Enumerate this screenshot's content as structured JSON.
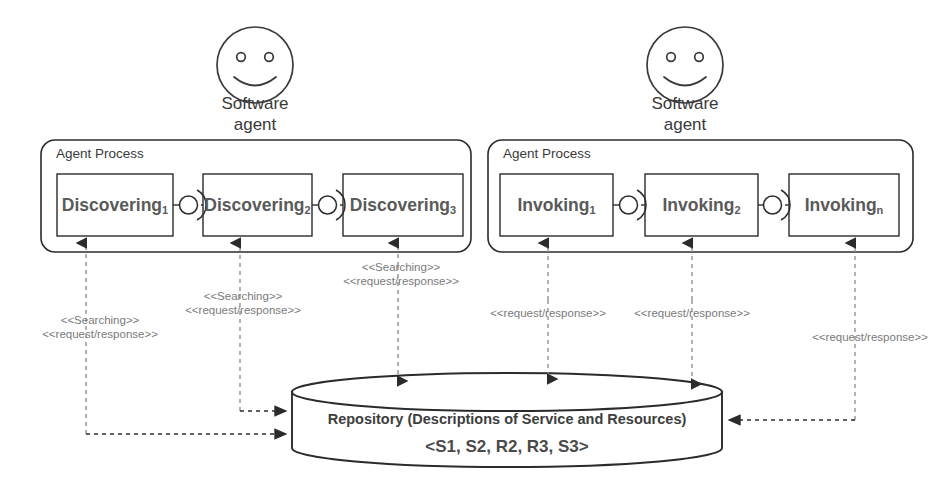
{
  "diagram": {
    "colors": {
      "stroke": "#2b2b2b",
      "dashed": "#8a8a8a",
      "text_dark": "#3a3a3a",
      "text_gray": "#6d6d6d",
      "node_text": "#5a5a5a",
      "background": "#ffffff"
    }
  },
  "actors": [
    {
      "id": "actor-left",
      "icon": "smiley-face-icon",
      "label_line1": "Software",
      "label_line2": "agent"
    },
    {
      "id": "actor-right",
      "icon": "smiley-face-icon",
      "label_line1": "Software",
      "label_line2": "agent"
    }
  ],
  "processes": [
    {
      "id": "agent-process-left",
      "title": "Agent Process",
      "nodes": [
        {
          "id": "discovering-1",
          "name": "Discovering",
          "subscript": "1"
        },
        {
          "id": "discovering-2",
          "name": "Discovering",
          "subscript": "2"
        },
        {
          "id": "discovering-3",
          "name": "Discovering",
          "subscript": "3"
        }
      ]
    },
    {
      "id": "agent-process-right",
      "title": "Agent Process",
      "nodes": [
        {
          "id": "invoking-1",
          "name": "Invoking",
          "subscript": "1"
        },
        {
          "id": "invoking-2",
          "name": "Invoking",
          "subscript": "2"
        },
        {
          "id": "invoking-n",
          "name": "Invoking",
          "subscript": "n"
        }
      ]
    }
  ],
  "repository": {
    "id": "repository-cylinder",
    "line1": "Repository (Descriptions of Service and Resources)",
    "line2": "<S1, S2, R2, R3, S3>"
  },
  "connector_labels": [
    {
      "id": "label-discovering-1",
      "line1": "<<Searching>>",
      "line2": "<<request/response>>"
    },
    {
      "id": "label-discovering-2",
      "line1": "<<Searching>>",
      "line2": "<<request/response>>"
    },
    {
      "id": "label-discovering-3",
      "line1": "<<Searching>>",
      "line2": "<<request/response>>"
    },
    {
      "id": "label-invoking-1",
      "line1": "<<request/response>>",
      "line2": ""
    },
    {
      "id": "label-invoking-2",
      "line1": "<<request/response>>",
      "line2": ""
    },
    {
      "id": "label-invoking-n",
      "line1": "<<request/response>>",
      "line2": ""
    }
  ]
}
